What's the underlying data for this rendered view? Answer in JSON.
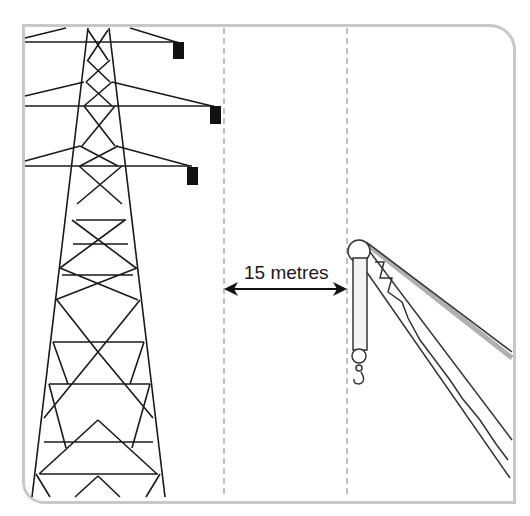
{
  "diagram": {
    "type": "safety-clearance-illustration",
    "distance_label": "15 metres",
    "elements": [
      "electricity-pylon",
      "clearance-zone",
      "crane-boom"
    ],
    "colors": {
      "frame": "#c8c8c8",
      "lines": "#1a1a1a",
      "guides": "#aaaaaa",
      "boom_shadow": "#b0b0b0"
    }
  }
}
